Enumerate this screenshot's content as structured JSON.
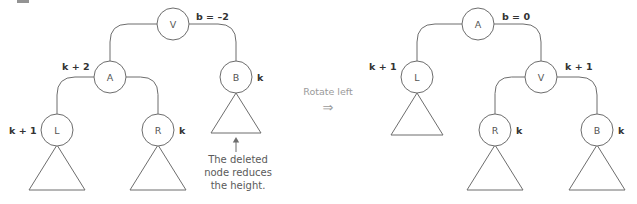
{
  "figure": {
    "stroke_color": "#6d6d6d",
    "label_color": "#333333",
    "caption_color": "#5a5a5a",
    "transition_color": "#9a9a9a"
  },
  "transition": {
    "label": "Rotate left",
    "arrow_glyph": "⇒"
  },
  "before_tree": {
    "name": "before-rotation-tree",
    "nodes": [
      {
        "id": "v",
        "label": "V",
        "cx": 173,
        "cy": 24,
        "r": 16
      },
      {
        "id": "a",
        "label": "A",
        "cx": 110,
        "cy": 77,
        "r": 16
      },
      {
        "id": "b",
        "label": "B",
        "cx": 236,
        "cy": 77,
        "r": 16
      },
      {
        "id": "l",
        "label": "L",
        "cx": 57,
        "cy": 130,
        "r": 16
      },
      {
        "id": "r",
        "label": "R",
        "cx": 158,
        "cy": 130,
        "r": 16
      }
    ],
    "annotations": [
      {
        "id": "v-balance",
        "text": "b = –2",
        "x": 196,
        "y": 16,
        "kind": "balance"
      },
      {
        "id": "a-height",
        "text": "k + 2",
        "x": 62,
        "y": 66,
        "kind": "height"
      },
      {
        "id": "b-height",
        "text": "k",
        "x": 257,
        "y": 77,
        "kind": "height"
      },
      {
        "id": "l-height",
        "text": "k + 1",
        "x": 9,
        "y": 130,
        "kind": "height"
      },
      {
        "id": "r-height",
        "text": "k",
        "x": 179,
        "y": 130,
        "kind": "height"
      }
    ],
    "subtrees": [
      {
        "id": "l-subtree",
        "apex_x": 57,
        "apex_y": 145,
        "half_width": 28,
        "height": 45
      },
      {
        "id": "r-subtree",
        "apex_x": 158,
        "apex_y": 145,
        "half_width": 28,
        "height": 45
      },
      {
        "id": "b-subtree",
        "apex_x": 236,
        "apex_y": 93,
        "half_width": 25,
        "height": 40
      }
    ],
    "caption": {
      "id": "deleted-node-caption",
      "lines": [
        "The deleted",
        "node reduces",
        "the height."
      ],
      "x": 238,
      "y_start": 163,
      "line_height": 13,
      "arrow": {
        "x": 236,
        "y_top": 137,
        "y_bottom": 152
      }
    }
  },
  "after_tree": {
    "name": "after-rotation-tree",
    "nodes": [
      {
        "id": "a",
        "label": "A",
        "cx": 478,
        "cy": 24,
        "r": 16
      },
      {
        "id": "l",
        "label": "L",
        "cx": 417,
        "cy": 77,
        "r": 16
      },
      {
        "id": "v",
        "label": "V",
        "cx": 541,
        "cy": 77,
        "r": 16
      },
      {
        "id": "r",
        "label": "R",
        "cx": 495,
        "cy": 130,
        "r": 16
      },
      {
        "id": "b",
        "label": "B",
        "cx": 597,
        "cy": 130,
        "r": 16
      }
    ],
    "annotations": [
      {
        "id": "a-balance",
        "text": "b = 0",
        "x": 502,
        "y": 16,
        "kind": "balance"
      },
      {
        "id": "l-height",
        "text": "k + 1",
        "x": 369,
        "y": 66,
        "kind": "height"
      },
      {
        "id": "v-height",
        "text": "k + 1",
        "x": 565,
        "y": 66,
        "kind": "height"
      },
      {
        "id": "r-height",
        "text": "k",
        "x": 516,
        "y": 130,
        "kind": "height"
      },
      {
        "id": "b-height",
        "text": "k",
        "x": 618,
        "y": 130,
        "kind": "height"
      }
    ],
    "subtrees": [
      {
        "id": "l-subtree",
        "apex_x": 417,
        "apex_y": 93,
        "half_width": 26,
        "height": 42
      },
      {
        "id": "r-subtree",
        "apex_x": 495,
        "apex_y": 145,
        "half_width": 28,
        "height": 45
      },
      {
        "id": "b-subtree",
        "apex_x": 597,
        "apex_y": 145,
        "half_width": 28,
        "height": 45
      }
    ]
  },
  "edges": {
    "before": [
      {
        "id": "v-to-a",
        "from": "v",
        "to": "a"
      },
      {
        "id": "v-to-b",
        "from": "v",
        "to": "b"
      },
      {
        "id": "a-to-l",
        "from": "a",
        "to": "l"
      },
      {
        "id": "a-to-r",
        "from": "a",
        "to": "r"
      }
    ],
    "after": [
      {
        "id": "a-to-l",
        "from": "a",
        "to": "l"
      },
      {
        "id": "a-to-v",
        "from": "a",
        "to": "v"
      },
      {
        "id": "v-to-r",
        "from": "v",
        "to": "r"
      },
      {
        "id": "v-to-b",
        "from": "v",
        "to": "b"
      }
    ]
  }
}
